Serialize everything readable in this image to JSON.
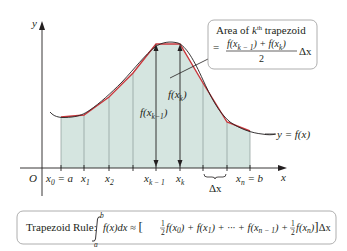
{
  "figure": {
    "axes": {
      "x_label": "x",
      "y_label": "y",
      "origin_label": "O"
    },
    "curve_label": "y = f(x)",
    "x_ticks": [
      {
        "base": "x",
        "sub": "0",
        "suffix": " = a"
      },
      {
        "base": "x",
        "sub": "1",
        "suffix": ""
      },
      {
        "base": "x",
        "sub": "2",
        "suffix": ""
      },
      {
        "base": "x",
        "sub": "k − 1",
        "suffix": ""
      },
      {
        "base": "x",
        "sub": "k",
        "suffix": ""
      },
      {
        "base": "x",
        "sub": "n",
        "suffix": " = b"
      }
    ],
    "delta_label": "Δx",
    "height_labels": {
      "left": {
        "prefix": "f(x",
        "sub": "k−1",
        "suffix": ")"
      },
      "right": {
        "prefix": "f(x",
        "sub": "k",
        "suffix": ")"
      }
    },
    "callout": {
      "line1_prefix": "Area of ",
      "line1_k": "k",
      "line1_sup": "th",
      "line1_suffix": " trapezoid",
      "equals": "=",
      "numerator": "f(x_{k − 1}) + f(x_k)",
      "numerator_parts": [
        "f(x",
        "k − 1",
        ") + f(x",
        "k",
        ")"
      ],
      "denominator": "2",
      "trailing": "Δx"
    },
    "colors": {
      "fill": "#d5e5e0",
      "curve": "#231f20",
      "trapezoid_top": "#c8363b",
      "grid": "#8a9a96"
    }
  },
  "formula_box": {
    "label": "Trapezoid Rule:",
    "integral_upper": "b",
    "integral_lower": "a",
    "integrand": "f(x)dx ≈ ",
    "bracket_open": "[",
    "half": "1",
    "half_den": "2",
    "term1": "f(x",
    "term1_sub": "0",
    "term1_end": ") + f(x",
    "term2_sub": "1",
    "term2_end": ") + ··· + f(x",
    "term3_sub": "n − 1",
    "term3_end": ") + ",
    "term4": "f(x",
    "term4_sub": "n",
    "term4_end": ")",
    "bracket_close": "]",
    "trailing": "Δx"
  }
}
